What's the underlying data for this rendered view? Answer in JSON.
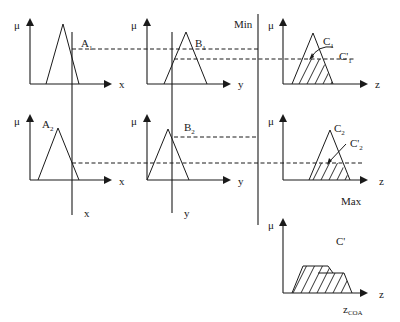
{
  "diagram": {
    "colors": {
      "ink": "#1a1a1a",
      "background": "#ffffff"
    },
    "axis_labels": {
      "mu": "μ",
      "x": "x",
      "y": "y",
      "z": "z"
    },
    "operators": {
      "min": "Min",
      "max": "Max"
    },
    "rules": [
      {
        "antecedent_1": {
          "label": "A",
          "sub": "1"
        },
        "antecedent_2": {
          "label": "B",
          "sub": "1"
        },
        "consequent": {
          "label": "C",
          "sub": "1"
        },
        "clipped_consequent": {
          "label": "C'",
          "sub": "1"
        }
      },
      {
        "antecedent_1": {
          "label": "A",
          "sub": "2"
        },
        "antecedent_2": {
          "label": "B",
          "sub": "2"
        },
        "consequent": {
          "label": "C",
          "sub": "2"
        },
        "clipped_consequent": {
          "label": "C'",
          "sub": "2"
        }
      }
    ],
    "inputs": {
      "x_label": "x",
      "y_label": "y"
    },
    "output": {
      "aggregate_label": "C'",
      "defuzzified_label": "z",
      "defuzzified_sub": "COA"
    }
  }
}
